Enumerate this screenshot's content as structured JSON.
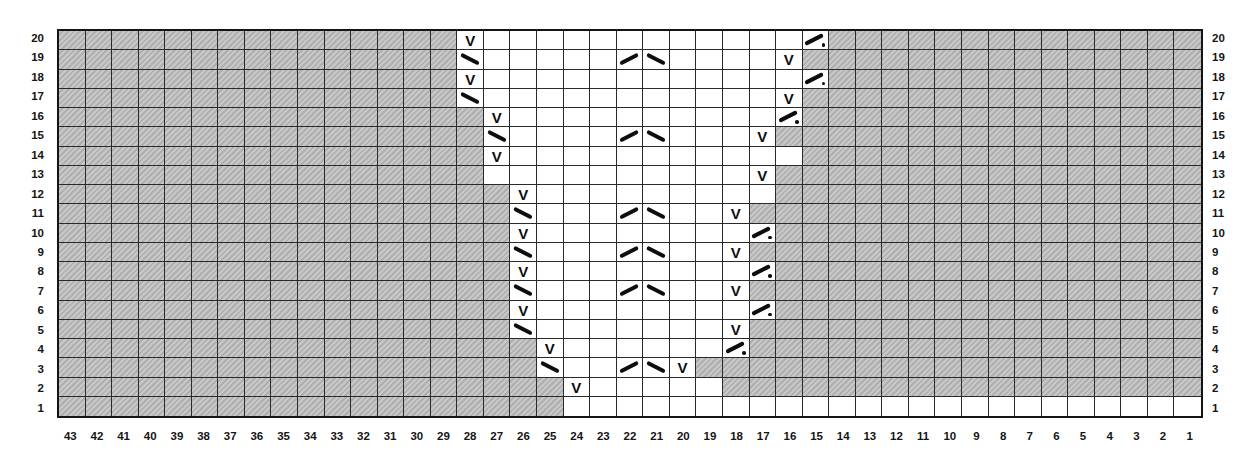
{
  "chart_data": {
    "type": "table",
    "subtype": "knitting-chart-grid",
    "title": "",
    "num_columns": 43,
    "num_rows": 20,
    "column_labels": [
      "43",
      "42",
      "41",
      "40",
      "39",
      "38",
      "37",
      "36",
      "35",
      "34",
      "33",
      "32",
      "31",
      "30",
      "29",
      "28",
      "27",
      "26",
      "25",
      "24",
      "23",
      "22",
      "21",
      "20",
      "19",
      "18",
      "17",
      "16",
      "15",
      "14",
      "13",
      "12",
      "11",
      "10",
      "9",
      "8",
      "7",
      "6",
      "5",
      "4",
      "3",
      "2",
      "1"
    ],
    "row_labels_top_to_bottom": [
      "20",
      "19",
      "18",
      "17",
      "16",
      "15",
      "14",
      "13",
      "12",
      "11",
      "10",
      "9",
      "8",
      "7",
      "6",
      "5",
      "4",
      "3",
      "2",
      "1"
    ],
    "row_labels_shown_on": [
      "left",
      "right"
    ],
    "symbol_glyphs_used": [
      "V",
      "\\",
      "/",
      "/."
    ],
    "rows": [
      {
        "row": 20,
        "white_from": 28,
        "white_to": 15,
        "symbols": [
          {
            "col": 28,
            "glyph": "V"
          },
          {
            "col": 15,
            "glyph": "/."
          }
        ]
      },
      {
        "row": 19,
        "white_from": 28,
        "white_to": 16,
        "symbols": [
          {
            "col": 28,
            "glyph": "\\"
          },
          {
            "col": 22,
            "glyph": "/"
          },
          {
            "col": 21,
            "glyph": "\\"
          },
          {
            "col": 16,
            "glyph": "V"
          }
        ]
      },
      {
        "row": 18,
        "white_from": 28,
        "white_to": 15,
        "symbols": [
          {
            "col": 28,
            "glyph": "V"
          },
          {
            "col": 15,
            "glyph": "/."
          }
        ]
      },
      {
        "row": 17,
        "white_from": 28,
        "white_to": 16,
        "symbols": [
          {
            "col": 28,
            "glyph": "\\"
          },
          {
            "col": 16,
            "glyph": "V"
          }
        ]
      },
      {
        "row": 16,
        "white_from": 27,
        "white_to": 16,
        "symbols": [
          {
            "col": 27,
            "glyph": "V"
          },
          {
            "col": 16,
            "glyph": "/."
          }
        ]
      },
      {
        "row": 15,
        "white_from": 27,
        "white_to": 17,
        "symbols": [
          {
            "col": 27,
            "glyph": "\\"
          },
          {
            "col": 22,
            "glyph": "/"
          },
          {
            "col": 21,
            "glyph": "\\"
          },
          {
            "col": 17,
            "glyph": "V"
          }
        ]
      },
      {
        "row": 14,
        "white_from": 27,
        "white_to": 16,
        "symbols": [
          {
            "col": 27,
            "glyph": "V"
          }
        ]
      },
      {
        "row": 13,
        "white_from": 27,
        "white_to": 17,
        "symbols": [
          {
            "col": 17,
            "glyph": "V"
          }
        ]
      },
      {
        "row": 12,
        "white_from": 26,
        "white_to": 17,
        "symbols": [
          {
            "col": 26,
            "glyph": "V"
          }
        ]
      },
      {
        "row": 11,
        "white_from": 26,
        "white_to": 18,
        "symbols": [
          {
            "col": 26,
            "glyph": "\\"
          },
          {
            "col": 22,
            "glyph": "/"
          },
          {
            "col": 21,
            "glyph": "\\"
          },
          {
            "col": 18,
            "glyph": "V"
          }
        ]
      },
      {
        "row": 10,
        "white_from": 26,
        "white_to": 17,
        "symbols": [
          {
            "col": 26,
            "glyph": "V"
          },
          {
            "col": 17,
            "glyph": "/."
          }
        ]
      },
      {
        "row": 9,
        "white_from": 26,
        "white_to": 18,
        "symbols": [
          {
            "col": 26,
            "glyph": "\\"
          },
          {
            "col": 22,
            "glyph": "/"
          },
          {
            "col": 21,
            "glyph": "\\"
          },
          {
            "col": 18,
            "glyph": "V"
          }
        ]
      },
      {
        "row": 8,
        "white_from": 26,
        "white_to": 17,
        "symbols": [
          {
            "col": 26,
            "glyph": "V"
          },
          {
            "col": 17,
            "glyph": "/."
          }
        ]
      },
      {
        "row": 7,
        "white_from": 26,
        "white_to": 18,
        "symbols": [
          {
            "col": 26,
            "glyph": "\\"
          },
          {
            "col": 22,
            "glyph": "/"
          },
          {
            "col": 21,
            "glyph": "\\"
          },
          {
            "col": 18,
            "glyph": "V"
          }
        ]
      },
      {
        "row": 6,
        "white_from": 26,
        "white_to": 17,
        "symbols": [
          {
            "col": 26,
            "glyph": "V"
          },
          {
            "col": 17,
            "glyph": "/."
          }
        ]
      },
      {
        "row": 5,
        "white_from": 26,
        "white_to": 18,
        "symbols": [
          {
            "col": 26,
            "glyph": "\\"
          },
          {
            "col": 18,
            "glyph": "V"
          }
        ]
      },
      {
        "row": 4,
        "white_from": 25,
        "white_to": 18,
        "symbols": [
          {
            "col": 25,
            "glyph": "V"
          },
          {
            "col": 18,
            "glyph": "/."
          }
        ]
      },
      {
        "row": 3,
        "white_from": 25,
        "white_to": 20,
        "symbols": [
          {
            "col": 25,
            "glyph": "\\"
          },
          {
            "col": 22,
            "glyph": "/"
          },
          {
            "col": 21,
            "glyph": "\\"
          },
          {
            "col": 20,
            "glyph": "V"
          }
        ]
      },
      {
        "row": 2,
        "white_from": 24,
        "white_to": 19,
        "symbols": [
          {
            "col": 24,
            "glyph": "V"
          }
        ]
      },
      {
        "row": 1,
        "white_from": 24,
        "white_to": 1,
        "symbols": []
      }
    ]
  },
  "colors": {
    "background": "#ffffff",
    "no_stitch_gray": "#bababa",
    "grid_line": "#2a2a2a",
    "grid_border": "#141414",
    "symbol": "#0d0d0d",
    "label_text": "#151515"
  }
}
